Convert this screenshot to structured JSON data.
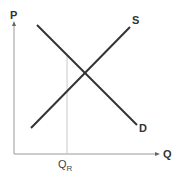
{
  "diagram": {
    "type": "supply-demand",
    "axes": {
      "y_label": "P",
      "x_label": "Q"
    },
    "curves": [
      {
        "name": "S",
        "label": "S",
        "from": [
          31,
          128
        ],
        "to": [
          130,
          27
        ]
      },
      {
        "name": "D",
        "label": "D",
        "from": [
          37,
          25
        ],
        "to": [
          137,
          125
        ]
      }
    ],
    "marker": {
      "label_main": "Q",
      "label_sub": "R",
      "x": 67
    },
    "colors": {
      "axis": "#9a9a9a",
      "curve": "#333333",
      "marker_line": "#c8c8c8",
      "text": "#333333"
    }
  }
}
